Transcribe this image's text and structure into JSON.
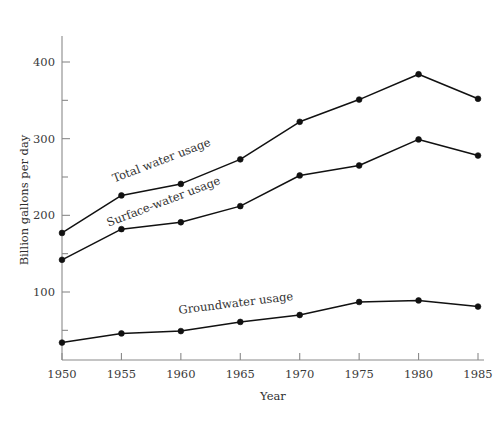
{
  "chart_data": {
    "type": "line",
    "title": "",
    "xlabel": "Year",
    "ylabel": "Billion gallons per day",
    "categories": [
      1950,
      1955,
      1960,
      1965,
      1970,
      1975,
      1980,
      1985
    ],
    "x": [
      1950,
      1955,
      1960,
      1965,
      1970,
      1975,
      1980,
      1985
    ],
    "xlim": [
      1948,
      1987
    ],
    "ylim": [
      0,
      440
    ],
    "x_tick_labels": [
      "1950",
      "1955",
      "1960",
      "1965",
      "1970",
      "1975",
      "1980",
      "1985"
    ],
    "y_tick_labels": [
      "100",
      "200",
      "300",
      "400"
    ],
    "y_major_ticks": [
      100,
      200,
      300,
      400
    ],
    "y_minor_ticks": [
      50,
      150,
      250,
      350
    ],
    "grid": false,
    "legend": "inline-labels",
    "series": [
      {
        "name": "Total water usage",
        "label": "Total water usage",
        "label_rotation": -21,
        "values": [
          177,
          226,
          241,
          273,
          322,
          351,
          384,
          352
        ]
      },
      {
        "name": "Surface-water usage",
        "label": "Surface-water usage",
        "label_rotation": -21,
        "values": [
          142,
          182,
          191,
          212,
          252,
          265,
          299,
          278
        ]
      },
      {
        "name": "Groundwater usage",
        "label": "Groundwater usage",
        "label_rotation": -7,
        "values": [
          34,
          46,
          49,
          61,
          70,
          87,
          89,
          81
        ]
      }
    ],
    "colors": {
      "line": "#111111",
      "marker": "#111111",
      "axis": "#8a8a8a",
      "text": "#333333",
      "background": "#ffffff"
    }
  }
}
